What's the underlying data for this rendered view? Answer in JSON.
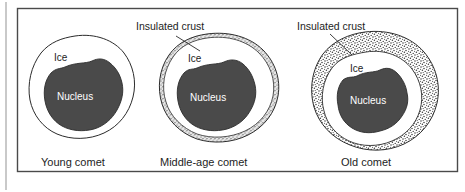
{
  "figure": {
    "background_color": "#ffffff",
    "frame_color": "#4a4a4a",
    "page_edge_line_color": "#c9c9c9",
    "nucleus_fill": "#4a4a4a",
    "ice_fill": "#ffffff",
    "crust_fill": "#d8d8d8",
    "outline_color": "#2b2b2b"
  },
  "panels": [
    {
      "id": "young-comet",
      "caption": "Young comet",
      "ice_label": "Ice",
      "nucleus_label": "Nucleus",
      "crust_label": null,
      "has_crust": false,
      "crust_style": "none"
    },
    {
      "id": "middle-age-comet",
      "caption": "Middle-age comet",
      "ice_label": "Ice",
      "nucleus_label": "Nucleus",
      "crust_label": "Insulated crust",
      "has_crust": true,
      "crust_style": "thin-band"
    },
    {
      "id": "old-comet",
      "caption": "Old comet",
      "ice_label": "Ice",
      "nucleus_label": "Nucleus",
      "crust_label": "Insulated crust",
      "has_crust": true,
      "crust_style": "thick-stippled"
    }
  ]
}
